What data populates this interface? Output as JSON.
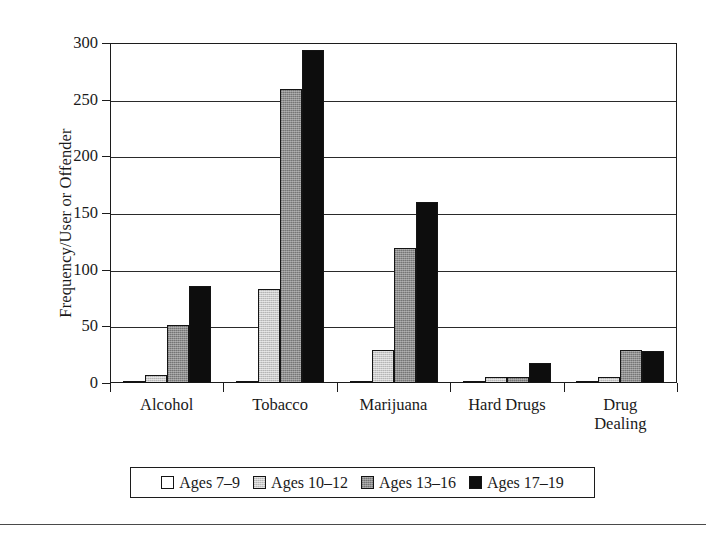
{
  "chart_data": {
    "type": "bar",
    "title": "",
    "subtitle": "",
    "xlabel": "",
    "ylabel": "Frequency/User or Offender",
    "ylim": [
      0,
      300
    ],
    "yticks": [
      0,
      50,
      100,
      150,
      200,
      250,
      300
    ],
    "ytick_labels": [
      "0",
      "50",
      "100",
      "150",
      "200",
      "250",
      "300"
    ],
    "grid": true,
    "legend_position": "bottom",
    "categories": [
      "Alcohol",
      "Tobacco",
      "Marijuana",
      "Hard Drugs",
      "Drug Dealing"
    ],
    "category_lines": [
      [
        "Alcohol"
      ],
      [
        "Tobacco"
      ],
      [
        "Marijuana"
      ],
      [
        "Hard Drugs"
      ],
      [
        "Drug",
        "Dealing"
      ]
    ],
    "series": [
      {
        "name": "Ages 7–9",
        "color": "#ffffff",
        "swatch": "white",
        "values": [
          2,
          1,
          1,
          2,
          0
        ]
      },
      {
        "name": "Ages 10–12",
        "color": "#c9c9c9",
        "swatch": "light-gray",
        "values": [
          7,
          83,
          29,
          5,
          5
        ]
      },
      {
        "name": "Ages 13–16",
        "color": "#8e8e8e",
        "swatch": "dark-gray",
        "values": [
          51,
          259,
          119,
          5,
          29
        ]
      },
      {
        "name": "Ages 17–19",
        "color": "#0d0d0d",
        "swatch": "black",
        "values": [
          86,
          294,
          160,
          18,
          28
        ]
      }
    ]
  },
  "legend": {
    "items": [
      {
        "label": "Ages 7–9"
      },
      {
        "label": "Ages 10–12"
      },
      {
        "label": "Ages 13–16"
      },
      {
        "label": "Ages 17–19"
      }
    ]
  }
}
